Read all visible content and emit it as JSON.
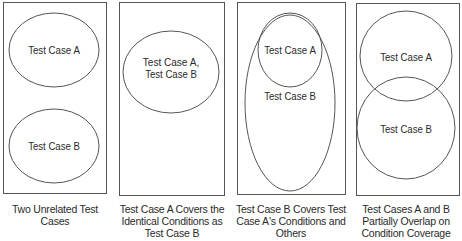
{
  "colors": {
    "stroke": "#555555",
    "text": "#2a2a2a",
    "background": "#ffffff"
  },
  "panels": [
    {
      "id": "panel-1",
      "box": {
        "x": 3,
        "y": 2,
        "w": 103,
        "h": 191
      },
      "shapes": [
        {
          "name": "test-case-a-ellipse",
          "cx": 54,
          "cy": 50,
          "rx": 45,
          "ry": 37
        },
        {
          "name": "test-case-b-ellipse",
          "cx": 54,
          "cy": 146,
          "rx": 45,
          "ry": 37
        }
      ],
      "labels": [
        {
          "text": "Test Case A",
          "x": 54,
          "y": 54
        },
        {
          "text": "Test Case B",
          "x": 54,
          "y": 150
        }
      ],
      "caption": [
        "Two Unrelated Test",
        "Cases"
      ],
      "caption_box": {
        "x": 0,
        "y": 203,
        "w": 110
      }
    },
    {
      "id": "panel-2",
      "box": {
        "x": 119,
        "y": 2,
        "w": 105,
        "h": 193
      },
      "shapes": [
        {
          "name": "test-case-ab-ellipse",
          "cx": 171,
          "cy": 72,
          "rx": 48,
          "ry": 41
        }
      ],
      "labels": [
        {
          "text": "Test Case A,",
          "x": 171,
          "y": 66
        },
        {
          "text": "Test Case B",
          "x": 171,
          "y": 78
        }
      ],
      "caption": [
        "Test Case A Covers the",
        "Identical Conditions as",
        "Test Case B"
      ],
      "caption_box": {
        "x": 113,
        "y": 203,
        "w": 118
      }
    },
    {
      "id": "panel-3",
      "box": {
        "x": 237,
        "y": 2,
        "w": 108,
        "h": 192
      },
      "shapes": [
        {
          "name": "test-case-b-ellipse",
          "cx": 290,
          "cy": 103,
          "rx": 45,
          "ry": 88
        },
        {
          "name": "test-case-a-ellipse",
          "cx": 290,
          "cy": 50,
          "rx": 32,
          "ry": 37
        }
      ],
      "labels": [
        {
          "text": "Test Case A",
          "x": 290,
          "y": 54
        },
        {
          "text": "Test Case B",
          "x": 290,
          "y": 100
        }
      ],
      "caption": [
        "Test Case B Covers Test",
        "Case A's Conditions and",
        "Others"
      ],
      "caption_box": {
        "x": 231,
        "y": 203,
        "w": 120
      }
    },
    {
      "id": "panel-4",
      "box": {
        "x": 356,
        "y": 3,
        "w": 103,
        "h": 192
      },
      "shapes": [
        {
          "name": "test-case-a-circle",
          "cx": 406,
          "cy": 56,
          "rx": 46,
          "ry": 45
        },
        {
          "name": "test-case-b-circle",
          "cx": 406,
          "cy": 128,
          "rx": 49,
          "ry": 51
        }
      ],
      "labels": [
        {
          "text": "Test Case A",
          "x": 406,
          "y": 61
        },
        {
          "text": "Test Case B",
          "x": 406,
          "y": 133
        }
      ],
      "caption": [
        "Test Cases A and B",
        "Partially Overlap on",
        "Condition Coverage"
      ],
      "caption_box": {
        "x": 350,
        "y": 203,
        "w": 112
      }
    }
  ]
}
